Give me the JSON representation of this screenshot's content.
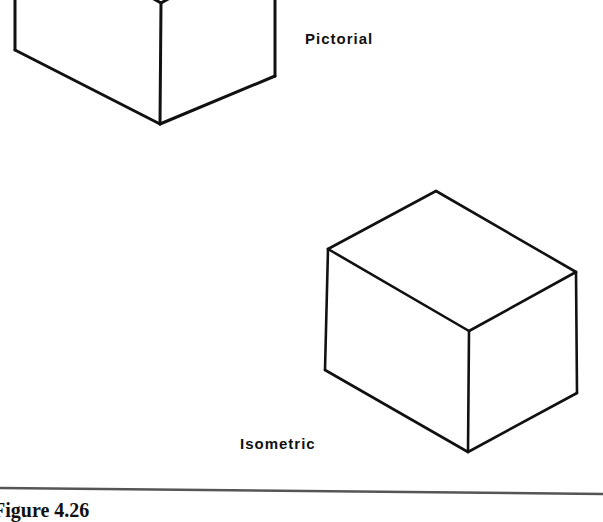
{
  "figure": {
    "caption": "Figure 4.26",
    "line_color": "#111111",
    "rule_color": "#555555"
  },
  "drawings": [
    {
      "name": "pictorial-cube",
      "label": "Pictorial",
      "edges": [
        [
          [
            15,
            0
          ],
          [
            15,
            50
          ]
        ],
        [
          [
            15,
            50
          ],
          [
            160,
            124
          ]
        ],
        [
          [
            161,
            3
          ],
          [
            160,
            124
          ]
        ],
        [
          [
            160,
            124
          ],
          [
            275,
            76
          ]
        ],
        [
          [
            275,
            0
          ],
          [
            275,
            76
          ]
        ],
        [
          [
            161,
            3
          ],
          [
            145,
            -6
          ]
        ],
        [
          [
            161,
            3
          ],
          [
            177,
            -6
          ]
        ]
      ]
    },
    {
      "name": "isometric-cube",
      "label": "Isometric",
      "edges": [
        [
          [
            328,
            249
          ],
          [
            436,
            191
          ]
        ],
        [
          [
            436,
            191
          ],
          [
            576,
            272
          ]
        ],
        [
          [
            328,
            249
          ],
          [
            469,
            331
          ]
        ],
        [
          [
            469,
            331
          ],
          [
            576,
            272
          ]
        ],
        [
          [
            328,
            249
          ],
          [
            325,
            370
          ]
        ],
        [
          [
            469,
            331
          ],
          [
            468,
            452
          ]
        ],
        [
          [
            576,
            272
          ],
          [
            577,
            393
          ]
        ],
        [
          [
            325,
            370
          ],
          [
            468,
            452
          ]
        ],
        [
          [
            468,
            452
          ],
          [
            577,
            393
          ]
        ]
      ]
    }
  ],
  "rule": {
    "x1": 0,
    "y1": 488,
    "x2": 603,
    "y2": 494
  }
}
